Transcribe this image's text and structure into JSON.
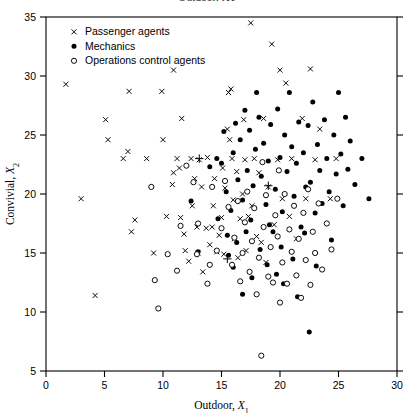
{
  "figure": {
    "clipped_title": "Outdoor, X1",
    "background_color": "#ffffff",
    "ink_color": "#000000"
  },
  "axes": {
    "x_label_main": "Outdoor,",
    "x_label_var": "X",
    "x_label_sub": "1",
    "y_label_main": "Convivial,",
    "y_label_var": "X",
    "y_label_sub": "2",
    "x_ticks": [
      "0",
      "5",
      "10",
      "15",
      "20",
      "25",
      "30"
    ],
    "y_ticks": [
      "5",
      "10",
      "15",
      "20",
      "25",
      "30",
      "35"
    ]
  },
  "legend": {
    "items": [
      {
        "label": "Passenger agents",
        "marker": "cross-marker",
        "color": "#000000"
      },
      {
        "label": "Mechanics",
        "marker": "filled-circle-marker",
        "color": "#000000"
      },
      {
        "label": "Operations control agents",
        "marker": "open-circle-marker",
        "color": "#000000"
      }
    ]
  },
  "chart_data": {
    "type": "scatter",
    "title": "Outdoor, X1",
    "xlabel": "Outdoor, X1",
    "ylabel": "Convivial, X2",
    "xlim": [
      0,
      30
    ],
    "ylim": [
      5,
      35
    ],
    "xticks": [
      0,
      5,
      10,
      15,
      20,
      25,
      30
    ],
    "yticks": [
      5,
      10,
      15,
      20,
      25,
      30,
      35
    ],
    "grid": false,
    "legend_position": "upper-left-inside",
    "series": [
      {
        "name": "Passenger agents",
        "marker": "x",
        "color": "#000000",
        "points": [
          [
            1.7,
            29.3
          ],
          [
            3.0,
            19.6
          ],
          [
            4.2,
            11.4
          ],
          [
            5.1,
            26.3
          ],
          [
            5.3,
            24.6
          ],
          [
            6.6,
            23.0
          ],
          [
            7.0,
            23.6
          ],
          [
            7.1,
            28.7
          ],
          [
            7.3,
            16.8
          ],
          [
            7.6,
            17.8
          ],
          [
            8.6,
            23.0
          ],
          [
            9.2,
            15.0
          ],
          [
            9.9,
            28.7
          ],
          [
            10.0,
            24.6
          ],
          [
            10.3,
            18.1
          ],
          [
            10.8,
            20.8
          ],
          [
            10.9,
            21.8
          ],
          [
            10.9,
            30.5
          ],
          [
            11.2,
            23.0
          ],
          [
            11.4,
            22.2
          ],
          [
            11.5,
            18.0
          ],
          [
            11.6,
            26.4
          ],
          [
            11.8,
            16.6
          ],
          [
            11.9,
            15.2
          ],
          [
            12.2,
            14.3
          ],
          [
            12.4,
            23.0
          ],
          [
            12.5,
            19.0
          ],
          [
            12.7,
            21.3
          ],
          [
            12.9,
            17.2
          ],
          [
            13.0,
            15.0
          ],
          [
            13.1,
            22.9
          ],
          [
            13.3,
            20.6
          ],
          [
            13.4,
            13.4
          ],
          [
            13.7,
            17.1
          ],
          [
            13.8,
            23.1
          ],
          [
            14.0,
            15.7
          ],
          [
            14.2,
            17.2
          ],
          [
            14.3,
            19.0
          ],
          [
            14.4,
            21.3
          ],
          [
            14.6,
            15.1
          ],
          [
            14.8,
            16.5
          ],
          [
            15.0,
            18.0
          ],
          [
            15.1,
            22.2
          ],
          [
            15.2,
            14.9
          ],
          [
            15.3,
            20.5
          ],
          [
            15.5,
            25.5
          ],
          [
            15.6,
            28.6
          ],
          [
            15.7,
            24.6
          ],
          [
            15.8,
            28.9
          ],
          [
            15.9,
            23.0
          ],
          [
            16.0,
            19.5
          ],
          [
            16.1,
            16.2
          ],
          [
            16.3,
            21.9
          ],
          [
            16.4,
            14.6
          ],
          [
            16.6,
            17.9
          ],
          [
            16.8,
            20.0
          ],
          [
            16.9,
            26.3
          ],
          [
            17.0,
            22.9
          ],
          [
            17.1,
            15.2
          ],
          [
            17.3,
            18.1
          ],
          [
            17.5,
            34.5
          ],
          [
            17.6,
            19.0
          ],
          [
            17.8,
            23.0
          ],
          [
            18.0,
            16.4
          ],
          [
            18.2,
            21.8
          ],
          [
            18.4,
            15.9
          ],
          [
            18.6,
            26.4
          ],
          [
            18.8,
            14.2
          ],
          [
            19.0,
            20.6
          ],
          [
            19.3,
            32.7
          ],
          [
            19.5,
            17.4
          ],
          [
            19.8,
            22.9
          ],
          [
            20.0,
            30.5
          ],
          [
            20.2,
            19.6
          ],
          [
            20.5,
            29.4
          ],
          [
            20.8,
            18.1
          ],
          [
            21.0,
            23.0
          ],
          [
            21.4,
            16.2
          ],
          [
            21.9,
            26.4
          ],
          [
            22.2,
            19.6
          ],
          [
            22.6,
            30.6
          ],
          [
            23.0,
            22.9
          ],
          [
            23.4,
            25.5
          ],
          [
            24.3,
            19.6
          ],
          [
            24.8,
            23.0
          ]
        ]
      },
      {
        "name": "Mechanics",
        "marker": "o",
        "color": "#000000",
        "points": [
          [
            13.0,
            15.1
          ],
          [
            14.0,
            22.3
          ],
          [
            14.6,
            23.0
          ],
          [
            15.0,
            22.6
          ],
          [
            15.2,
            25.3
          ],
          [
            15.4,
            20.2
          ],
          [
            15.6,
            14.8
          ],
          [
            15.8,
            18.6
          ],
          [
            16.0,
            23.5
          ],
          [
            16.2,
            26.0
          ],
          [
            16.4,
            21.2
          ],
          [
            16.6,
            24.6
          ],
          [
            16.8,
            19.5
          ],
          [
            17.0,
            27.1
          ],
          [
            17.2,
            22.0
          ],
          [
            17.4,
            25.4
          ],
          [
            17.5,
            17.8
          ],
          [
            17.7,
            20.7
          ],
          [
            17.9,
            23.8
          ],
          [
            18.0,
            28.6
          ],
          [
            18.2,
            26.5
          ],
          [
            18.4,
            21.5
          ],
          [
            18.6,
            24.3
          ],
          [
            18.8,
            19.1
          ],
          [
            19.0,
            22.8
          ],
          [
            19.2,
            25.9
          ],
          [
            19.4,
            16.8
          ],
          [
            19.6,
            20.4
          ],
          [
            19.8,
            27.2
          ],
          [
            20.0,
            23.1
          ],
          [
            20.2,
            18.5
          ],
          [
            20.4,
            25.0
          ],
          [
            20.6,
            21.9
          ],
          [
            20.8,
            28.6
          ],
          [
            21.0,
            24.0
          ],
          [
            21.2,
            19.8
          ],
          [
            21.4,
            22.6
          ],
          [
            21.6,
            26.1
          ],
          [
            21.8,
            17.2
          ],
          [
            22.0,
            23.5
          ],
          [
            22.2,
            20.6
          ],
          [
            22.4,
            25.8
          ],
          [
            22.6,
            21.0
          ],
          [
            22.8,
            27.8
          ],
          [
            23.0,
            18.4
          ],
          [
            23.2,
            24.2
          ],
          [
            23.4,
            22.0
          ],
          [
            23.6,
            19.2
          ],
          [
            23.8,
            26.3
          ],
          [
            24.0,
            23.0
          ],
          [
            24.2,
            20.2
          ],
          [
            24.4,
            16.1
          ],
          [
            24.6,
            25.0
          ],
          [
            24.8,
            21.7
          ],
          [
            25.0,
            28.6
          ],
          [
            25.2,
            23.4
          ],
          [
            25.4,
            19.0
          ],
          [
            25.6,
            26.5
          ],
          [
            25.8,
            22.1
          ],
          [
            26.0,
            24.5
          ],
          [
            26.4,
            20.8
          ],
          [
            27.0,
            23.0
          ],
          [
            27.6,
            19.6
          ],
          [
            22.5,
            8.3
          ],
          [
            20.3,
            12.4
          ],
          [
            19.7,
            13.2
          ],
          [
            18.9,
            14.0
          ],
          [
            17.6,
            12.9
          ],
          [
            16.8,
            11.5
          ],
          [
            16.0,
            13.8
          ],
          [
            21.5,
            11.3
          ],
          [
            14.7,
            17.9
          ],
          [
            15.5,
            16.5
          ],
          [
            16.3,
            15.9
          ],
          [
            17.1,
            16.8
          ],
          [
            18.3,
            15.3
          ],
          [
            19.1,
            17.4
          ],
          [
            20.1,
            15.5
          ],
          [
            21.1,
            14.5
          ],
          [
            22.1,
            16.7
          ],
          [
            23.1,
            13.9
          ],
          [
            12.4,
            19.4
          ]
        ]
      },
      {
        "name": "Operations control agents",
        "marker": "open-o",
        "color": "#000000",
        "points": [
          [
            9.0,
            20.6
          ],
          [
            9.3,
            12.7
          ],
          [
            9.6,
            10.3
          ],
          [
            11.2,
            13.5
          ],
          [
            12.9,
            14.9
          ],
          [
            13.8,
            12.4
          ],
          [
            14.2,
            20.6
          ],
          [
            14.6,
            15.2
          ],
          [
            15.0,
            17.1
          ],
          [
            15.3,
            21.1
          ],
          [
            15.6,
            18.9
          ],
          [
            15.9,
            14.0
          ],
          [
            16.1,
            16.3
          ],
          [
            16.4,
            19.4
          ],
          [
            16.6,
            12.6
          ],
          [
            16.8,
            15.0
          ],
          [
            17.0,
            17.6
          ],
          [
            17.2,
            20.2
          ],
          [
            17.4,
            13.4
          ],
          [
            17.6,
            16.0
          ],
          [
            17.8,
            18.8
          ],
          [
            18.0,
            11.5
          ],
          [
            18.2,
            14.6
          ],
          [
            18.4,
            6.3
          ],
          [
            18.6,
            17.2
          ],
          [
            18.8,
            19.9
          ],
          [
            19.0,
            13.0
          ],
          [
            19.2,
            15.5
          ],
          [
            19.4,
            12.5
          ],
          [
            19.6,
            18.2
          ],
          [
            19.8,
            16.4
          ],
          [
            20.0,
            10.8
          ],
          [
            20.2,
            14.2
          ],
          [
            20.4,
            20.0
          ],
          [
            20.6,
            12.4
          ],
          [
            20.8,
            17.0
          ],
          [
            21.0,
            15.1
          ],
          [
            21.2,
            19.0
          ],
          [
            21.4,
            13.1
          ],
          [
            21.6,
            16.2
          ],
          [
            21.8,
            11.2
          ],
          [
            22.0,
            18.4
          ],
          [
            22.2,
            14.4
          ],
          [
            22.4,
            20.4
          ],
          [
            22.6,
            12.3
          ],
          [
            22.8,
            16.8
          ],
          [
            23.0,
            15.0
          ],
          [
            23.3,
            19.2
          ],
          [
            23.6,
            13.6
          ],
          [
            24.0,
            17.5
          ],
          [
            24.4,
            15.3
          ],
          [
            24.9,
            19.6
          ],
          [
            13.0,
            17.5
          ],
          [
            14.0,
            14.0
          ],
          [
            11.5,
            17.3
          ],
          [
            10.4,
            14.9
          ],
          [
            12.0,
            22.4
          ],
          [
            12.6,
            21.0
          ],
          [
            19.9,
            22.0
          ],
          [
            18.5,
            22.7
          ]
        ]
      },
      {
        "name": "Group centroids",
        "marker": "+",
        "color": "#000000",
        "points": [
          [
            13.1,
            23.0
          ],
          [
            15.5,
            14.5
          ],
          [
            19.0,
            20.7
          ]
        ]
      }
    ]
  }
}
